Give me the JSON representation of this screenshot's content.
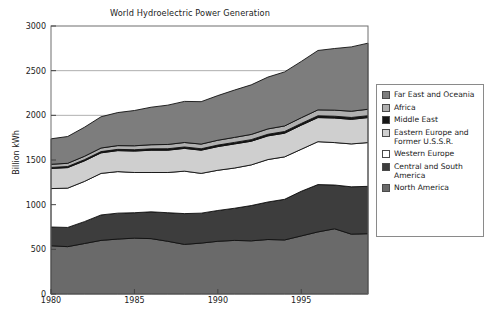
{
  "figure": {
    "title": "World Hydroelectric Power Generation",
    "caption": ""
  },
  "axes": {
    "ylabel": "Billion kWh",
    "yticks": [
      "0",
      "500",
      "1000",
      "1500",
      "2000",
      "2500",
      "3000"
    ],
    "xticks": [
      "1980",
      "1985",
      "1990",
      "1995"
    ]
  },
  "legend": {
    "items": [
      {
        "label": "Far East and Oceania",
        "color": "#7d7d7d"
      },
      {
        "label": "Africa",
        "color": "#b0b0b0"
      },
      {
        "label": "Middle East",
        "color": "#171717"
      },
      {
        "label": "Eastern Europe and Former U.S.S.R.",
        "color": "#cfcfcf"
      },
      {
        "label": "Western Europe",
        "color": "#ffffff"
      },
      {
        "label": "Central and South America",
        "color": "#3d3d3d"
      },
      {
        "label": "North America",
        "color": "#6a6a6a"
      }
    ]
  },
  "chart_data": {
    "type": "area",
    "stacked": true,
    "title": "World Hydroelectric Power Generation",
    "xlabel": "",
    "ylabel": "Billion kWh",
    "xlim": [
      1980,
      1999
    ],
    "ylim": [
      0,
      3000
    ],
    "grid": true,
    "gridlines_y": [
      1000,
      1500,
      2000,
      2500
    ],
    "legend_position": "right",
    "x": [
      1980,
      1981,
      1982,
      1983,
      1984,
      1985,
      1986,
      1987,
      1988,
      1989,
      1990,
      1991,
      1992,
      1993,
      1994,
      1995,
      1996,
      1997,
      1998,
      1999
    ],
    "series": [
      {
        "name": "North America",
        "color": "#6a6a6a",
        "values": [
          540,
          530,
          565,
          600,
          615,
          625,
          620,
          590,
          555,
          570,
          590,
          600,
          595,
          610,
          605,
          650,
          695,
          730,
          670,
          675
        ]
      },
      {
        "name": "Central and South America",
        "color": "#3d3d3d",
        "values": [
          210,
          215,
          245,
          285,
          290,
          285,
          300,
          320,
          345,
          335,
          345,
          360,
          395,
          420,
          455,
          500,
          530,
          490,
          530,
          530
        ]
      },
      {
        "name": "Western Europe",
        "color": "#ffffff",
        "values": [
          430,
          440,
          450,
          465,
          465,
          450,
          440,
          450,
          475,
          445,
          450,
          450,
          455,
          475,
          475,
          470,
          480,
          475,
          480,
          490
        ]
      },
      {
        "name": "Eastern Europe and Former U.S.S.R.",
        "color": "#cfcfcf",
        "values": [
          225,
          230,
          230,
          230,
          235,
          240,
          250,
          250,
          255,
          260,
          265,
          270,
          265,
          265,
          265,
          270,
          270,
          275,
          275,
          280
        ]
      },
      {
        "name": "Middle East",
        "color": "#171717",
        "values": [
          12,
          12,
          13,
          14,
          14,
          15,
          15,
          16,
          16,
          16,
          17,
          17,
          18,
          18,
          19,
          19,
          20,
          20,
          21,
          21
        ]
      },
      {
        "name": "Africa",
        "color": "#b0b0b0",
        "values": [
          35,
          36,
          38,
          40,
          42,
          44,
          46,
          48,
          50,
          52,
          54,
          56,
          58,
          60,
          62,
          64,
          66,
          68,
          70,
          72
        ]
      },
      {
        "name": "Far East and Oceania",
        "color": "#7d7d7d",
        "values": [
          285,
          300,
          325,
          350,
          370,
          395,
          420,
          440,
          460,
          475,
          500,
          530,
          555,
          580,
          605,
          630,
          665,
          690,
          720,
          740
        ]
      }
    ]
  }
}
